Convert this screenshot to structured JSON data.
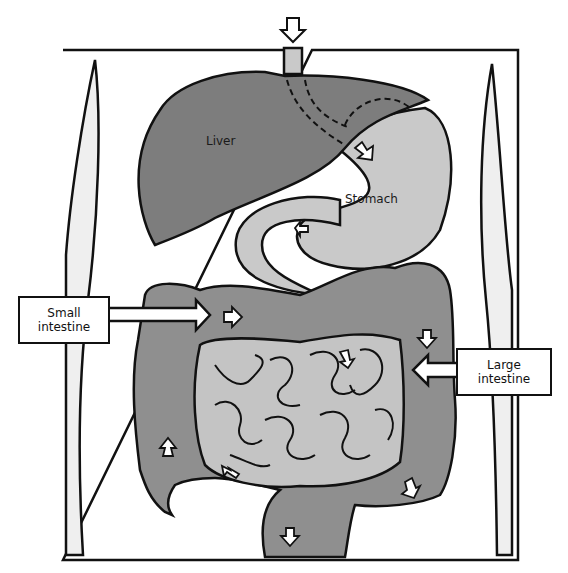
{
  "diagram": {
    "labels": {
      "liver": "Liver",
      "stomach": "Stomach",
      "small_intestine_line1": "Small",
      "small_intestine_line2": "intestine",
      "large_intestine_line1": "Large",
      "large_intestine_line2": "intestine"
    },
    "colors": {
      "liver": "#7d7d7d",
      "stomach": "#c9c9c9",
      "small_intestine": "#c4c4c4",
      "large_intestine": "#8f8f8f",
      "muscle": "#efefef",
      "outline": "#111111",
      "background": "#ffffff"
    }
  }
}
